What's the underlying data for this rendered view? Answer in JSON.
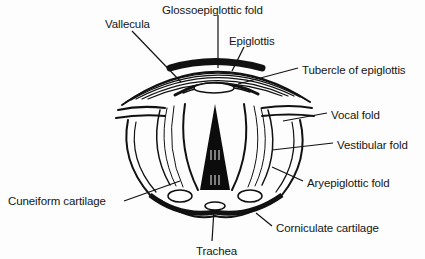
{
  "figure": {
    "labels": [
      {
        "id": "glossoepiglottic-fold",
        "text": "Glossoepiglottic fold",
        "x": 162,
        "y": 4
      },
      {
        "id": "vallecula",
        "text": "Vallecula",
        "x": 105,
        "y": 18
      },
      {
        "id": "epiglottis",
        "text": "Epiglottis",
        "x": 229,
        "y": 35
      },
      {
        "id": "tubercle-of-epiglottis",
        "text": "Tubercle of epiglottis",
        "x": 302,
        "y": 64
      },
      {
        "id": "vocal-fold",
        "text": "Vocal fold",
        "x": 331,
        "y": 109
      },
      {
        "id": "vestibular-fold",
        "text": "Vestibular fold",
        "x": 337,
        "y": 139
      },
      {
        "id": "aryepiglottic-fold",
        "text": "Aryepiglottic fold",
        "x": 307,
        "y": 177
      },
      {
        "id": "cuneiform-cartilage",
        "text": "Cuneiform cartilage",
        "x": 8,
        "y": 195
      },
      {
        "id": "corniculate-cartilage",
        "text": "Corniculate cartilage",
        "x": 276,
        "y": 222
      },
      {
        "id": "trachea",
        "text": "Trachea",
        "x": 196,
        "y": 245
      }
    ]
  }
}
